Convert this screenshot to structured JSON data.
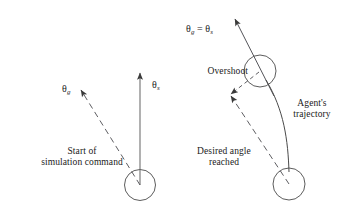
{
  "figure": {
    "type": "diagram",
    "background_color": "#ffffff",
    "stroke_color": "#3a3a3a",
    "width": 343,
    "height": 221
  },
  "labels": {
    "theta_g_left": {
      "base": "θ",
      "sub": "g"
    },
    "theta_s_left": {
      "base": "θ",
      "sub": "s"
    },
    "theta_equality_right": {
      "base": "θ",
      "sub": "g",
      "relation": " = θ",
      "sub2": "s"
    },
    "overshoot": "Overshoot",
    "agents_trajectory": "Agent's\ntrajectory",
    "start_of_simulation": "Start of\nsimulation command",
    "desired_angle_reached": "Desired angle\nreached"
  },
  "shapes": {
    "left_body_circle": {
      "cx": 140,
      "cy": 185,
      "r": 15.5
    },
    "upper_right_body_circle": {
      "cx": 260,
      "cy": 71,
      "r": 16
    },
    "lower_right_body_circle": {
      "cx": 289,
      "cy": 184,
      "r": 16
    },
    "left_solid_arrow": {
      "x1": 140,
      "y1": 185,
      "x2": 140,
      "y2": 72,
      "style": "solid"
    },
    "left_dashed_arrow": {
      "x1": 140,
      "y1": 185,
      "x2": 79,
      "y2": 88,
      "style": "dashed"
    },
    "right_solid_arrow": {
      "x1": 268,
      "y1": 80,
      "x2": 233,
      "y2": 17,
      "style": "solid"
    },
    "right_short_dashed_arrow": {
      "x1": 259,
      "y1": 72,
      "x2": 229,
      "y2": 95,
      "style": "dashed"
    },
    "right_long_dashed_arrow": {
      "x1": 289,
      "y1": 184,
      "x2": 229,
      "y2": 95,
      "style": "dashed"
    },
    "agent_trajectory_curve": {
      "from": [
        289,
        172
      ],
      "to": [
        266,
        79
      ],
      "bow": "right"
    }
  }
}
